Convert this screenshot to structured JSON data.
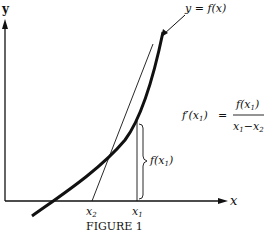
{
  "figure": {
    "caption": "FIGURE 1",
    "axes": {
      "x_label": "x",
      "y_label": "y"
    },
    "curve_label": "y = f(x)",
    "points": {
      "x1_label": "x",
      "x1_sub": "1",
      "x2_label": "x",
      "x2_sub": "2"
    },
    "brace_label": {
      "text": "f(x",
      "sub": "1",
      "close": ")"
    },
    "formula": {
      "lhs": "f′(x",
      "lhs_sub": "1",
      "lhs_close": ")",
      "equals": "=",
      "numerator": "f(x",
      "numerator_sub": "1",
      "numerator_close": ")",
      "denominator_a": "x",
      "denominator_a_sub": "1",
      "denominator_minus": "−",
      "denominator_b": "x",
      "denominator_b_sub": "2"
    },
    "colors": {
      "ink": "#111111",
      "background": "#ffffff"
    }
  }
}
